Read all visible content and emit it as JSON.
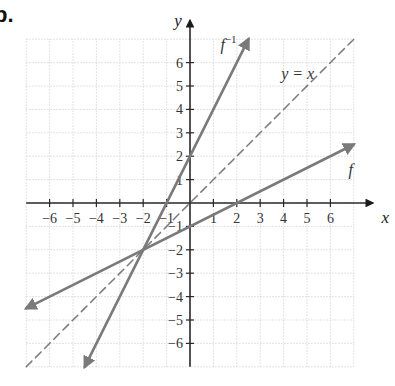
{
  "figure_label": "b.",
  "chart_data": {
    "type": "line",
    "title": "",
    "xlabel": "x",
    "ylabel": "y",
    "xlim": [
      -7,
      7
    ],
    "ylim": [
      -7,
      7
    ],
    "grid": true,
    "x_ticks": [
      -6,
      -5,
      -4,
      -3,
      -2,
      -1,
      1,
      2,
      3,
      4,
      5,
      6
    ],
    "y_ticks": [
      -6,
      -5,
      -4,
      -3,
      -2,
      -1,
      1,
      2,
      3,
      4,
      5,
      6
    ],
    "x_tick_labels": [
      "−6",
      "−5",
      "−4",
      "−3",
      "−2",
      "−1",
      "1",
      "2",
      "3",
      "4",
      "5",
      "6"
    ],
    "y_tick_labels": [
      "−6",
      "−5",
      "−4",
      "−3",
      "−2",
      "−1",
      "1",
      "2",
      "3",
      "4",
      "5",
      "6"
    ],
    "series": [
      {
        "name": "f",
        "label": "f",
        "equation": "y = x/2 - 1",
        "style": "solid",
        "arrows": "both",
        "points": [
          [
            -7,
            -4.5
          ],
          [
            -2,
            -2
          ],
          [
            0,
            -1
          ],
          [
            2,
            0
          ],
          [
            7,
            2.5
          ]
        ]
      },
      {
        "name": "f^-1",
        "label": "f",
        "label_superscript": "−1",
        "equation": "y = 2x + 2",
        "style": "solid",
        "arrows": "both",
        "points": [
          [
            -4.5,
            -7
          ],
          [
            -2,
            -2
          ],
          [
            -1,
            0
          ],
          [
            0,
            2
          ],
          [
            2.5,
            7
          ]
        ]
      },
      {
        "name": "y = x",
        "label": "y = x",
        "equation": "y = x",
        "style": "dashed",
        "arrows": "none",
        "points": [
          [
            -7,
            -7
          ],
          [
            0,
            0
          ],
          [
            7,
            7
          ]
        ]
      }
    ],
    "annotations": [
      {
        "text": "f⁻¹",
        "near": [
          1.3,
          6.7
        ]
      },
      {
        "text": "y = x",
        "near": [
          4.6,
          5.5
        ]
      },
      {
        "text": "f",
        "near": [
          7.2,
          1.4
        ]
      }
    ],
    "intersection": [
      -2,
      -2
    ],
    "colors": {
      "curve": "#7a7a7a",
      "axis": "#2a2a2a",
      "grid": "#cfcfcf"
    }
  }
}
